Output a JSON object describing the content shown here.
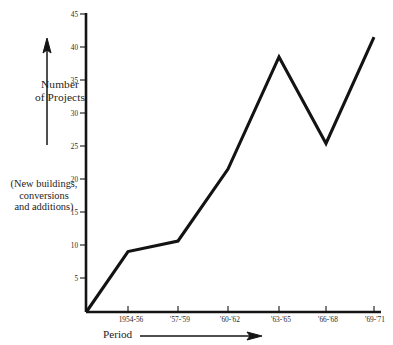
{
  "chart_data": {
    "type": "line",
    "title": "",
    "subtitle": "",
    "xlabel": "Period",
    "ylabel": "Number of Projects",
    "ylabel_note": "(New buildings, conversions and additions)",
    "categories": [
      "1954-56",
      "'57-'59",
      "'60-'62",
      "'63-'65",
      "'66-'68",
      "'69-'71"
    ],
    "values": [
      9,
      10.6,
      21.5,
      38.5,
      25.4,
      41.5
    ],
    "origin_value": 0,
    "ylim": [
      0,
      45
    ],
    "xlim_note": "origin at axis corner before first category",
    "ytick_labels": [
      "45",
      "40",
      "35",
      "30",
      "25",
      "20",
      "15",
      "10",
      "5"
    ],
    "yticks": [
      45,
      40,
      35,
      30,
      25,
      20,
      15,
      10,
      5
    ],
    "grid": false,
    "legend": "none",
    "series": [
      {
        "name": "Number of Projects",
        "values": [
          9,
          10.6,
          21.5,
          38.5,
          25.4,
          41.5
        ]
      }
    ]
  },
  "axes": {
    "y_axis_caption_line1": "Number",
    "y_axis_caption_line2": "of Projects",
    "y_axis_note_line1": "(New buildings,",
    "y_axis_note_line2": "conversions",
    "y_axis_note_line3": "and additions)",
    "x_axis_caption": "Period",
    "y_arrow_icon": "up-arrow-icon",
    "x_arrow_icon": "right-arrow-icon"
  },
  "ticks": {
    "y": [
      {
        "label": "45",
        "value": 45
      },
      {
        "label": "40",
        "value": 40
      },
      {
        "label": "35",
        "value": 35
      },
      {
        "label": "30",
        "value": 30
      },
      {
        "label": "25",
        "value": 25
      },
      {
        "label": "20",
        "value": 20
      },
      {
        "label": "15",
        "value": 15
      },
      {
        "label": "10",
        "value": 10
      },
      {
        "label": "5",
        "value": 5
      }
    ],
    "x": [
      {
        "label": "1954-56"
      },
      {
        "label": "'57-'59"
      },
      {
        "label": "'60-'62"
      },
      {
        "label": "'63-'65"
      },
      {
        "label": "'66-'68"
      },
      {
        "label": "'69-'71"
      }
    ]
  },
  "colors": {
    "line": "#131313",
    "axis": "#141414",
    "text": "#1d1d1d",
    "background": "#ffffff"
  }
}
